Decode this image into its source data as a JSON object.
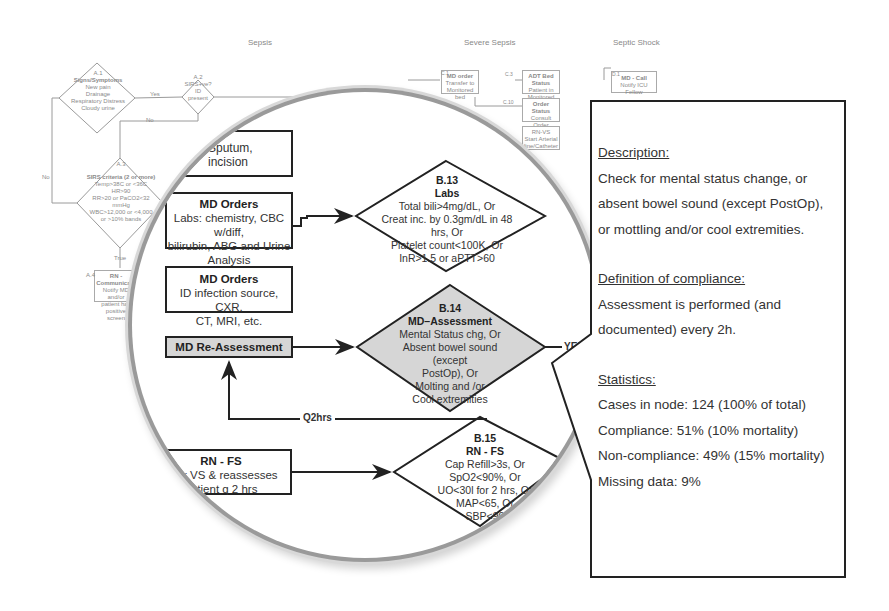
{
  "background_flowchart": {
    "column_titles": [
      "Sepsis",
      "Severe Sepsis",
      "Septic Shock"
    ],
    "nodes": {
      "a1": {
        "id": "A.1",
        "title": "Signs/Symptoms",
        "lines": [
          "New pain",
          "Drainage",
          "Respiratory Distress",
          "Cloudy urine"
        ]
      },
      "a2": {
        "id": "A.2",
        "lines": [
          "SIRS+ve?",
          "ID",
          "present"
        ]
      },
      "a3": {
        "id": "A.3",
        "title": "SIRS criteria (2 or more)",
        "lines": [
          "Temp>38C or <36C",
          "HR>90",
          "RR>20 or PaCO2<32 mmHg",
          "WBC>12,000 or <4,000 or >10% bands"
        ]
      },
      "a4": {
        "id": "A.4",
        "title": "RN - Communicate",
        "lines": [
          "Notify MD and/or",
          "patient has positive",
          "screen"
        ]
      },
      "c1": {
        "id": "C.1",
        "title": "MD order",
        "lines": [
          "Transfer to",
          "Monitored bed"
        ]
      },
      "c3": {
        "id": "C.3",
        "title": "ADT Bed Status",
        "lines": [
          "Patient in Monitored",
          "bed"
        ]
      },
      "c10": {
        "id": "C.10",
        "title": "Order Status",
        "lines": [
          "Consult Order",
          "Completed"
        ]
      },
      "c_rn": {
        "title": "RN-VS",
        "lines": [
          "Start Arterial",
          "line/Catheter"
        ]
      },
      "d1": {
        "id": "D.1",
        "title": "MD - Call",
        "lines": [
          "Notify ICU Fellow"
        ]
      }
    },
    "edge_labels": {
      "yes": "Yes",
      "no": "No",
      "true": "True"
    }
  },
  "magnifier": {
    "b_sputum": {
      "id": "B.1",
      "lines": [
        "Sputum,",
        "incision"
      ]
    },
    "md_orders_labs": {
      "title": "MD Orders",
      "lines": [
        "Labs: chemistry, CBC w/diff,",
        "bilirubin, ABG and Urine",
        "Analysis"
      ]
    },
    "md_orders_id": {
      "title": "MD Orders",
      "lines": [
        "ID infection source, CXR,",
        "CT, MRI, etc."
      ]
    },
    "md_reassessment": {
      "title": "MD Re-Assessment"
    },
    "rn_fs_box": {
      "title": "RN - FS",
      "lines": [
        "nitor VS & reassesses",
        "patient q 2 hrs"
      ]
    },
    "b13": {
      "id": "B.13",
      "title": "Labs",
      "lines": [
        "Total bili>4mg/dL, Or",
        "Creat inc. by 0.3gm/dL in 48 hrs, Or",
        "Platelet count<100K, Or",
        "InR>1.5 or aPTT>60"
      ]
    },
    "b14": {
      "id": "B.14",
      "title": "MD–Assessment",
      "lines": [
        "Mental Status chg, Or",
        "Absent bowel sound (except",
        "PostOp), Or",
        "Molting and /or",
        "Cool extremities"
      ]
    },
    "b15": {
      "id": "B.15",
      "title": "RN - FS",
      "lines": [
        "Cap Refill>3s, Or",
        "SpO2<90%, Or",
        "UO<30l for 2 hrs, Or",
        "MAP<65, Or",
        "SBP<90"
      ]
    },
    "edge_labels": {
      "yes": "YES",
      "q2hrs": "Q2hrs"
    }
  },
  "callout": {
    "description_heading": "Description:",
    "description_lines": [
      "Check for mental status change, or",
      "absent bowel sound (except PostOp),",
      "or mottling and/or cool extremities."
    ],
    "compliance_heading": "Definition of compliance:",
    "compliance_lines": [
      "Assessment is performed (and",
      "documented) every 2h."
    ],
    "statistics_heading": "Statistics:",
    "statistics_lines": [
      "Cases in node: 124 (100% of total)",
      "Compliance: 51% (10% mortality)",
      "Non-compliance: 49% (15% mortality)",
      "Missing data: 9%"
    ]
  }
}
